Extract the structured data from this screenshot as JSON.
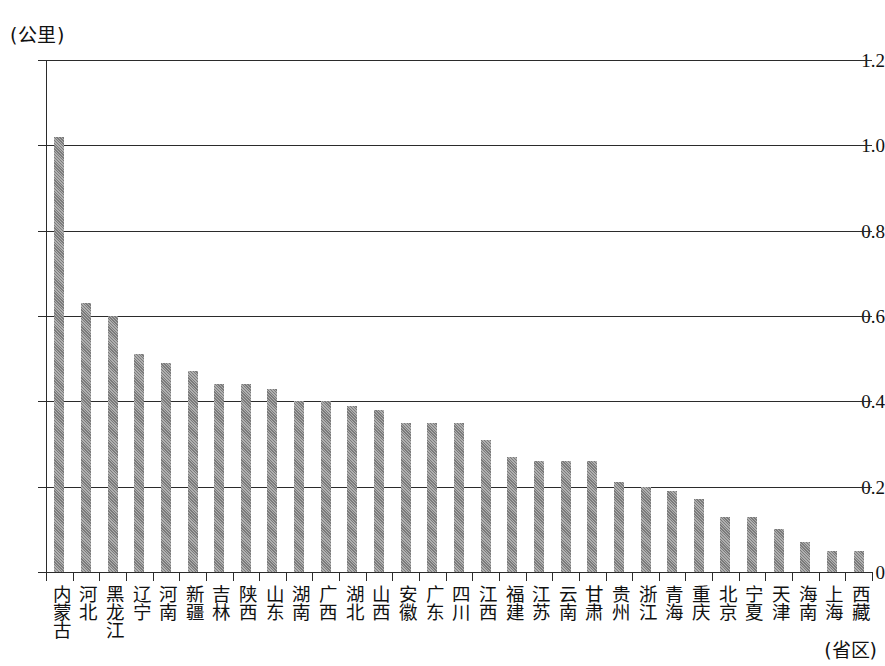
{
  "chart_data": {
    "type": "bar",
    "title": "",
    "subtitle": "",
    "ylabel": "(公里)",
    "xlabel": "(省区)",
    "ylim": [
      0,
      1.2
    ],
    "ytick_labels": [
      "0",
      "0.2",
      "0.4",
      "0.6",
      "0.8",
      "1.0",
      "1.2"
    ],
    "ytick_values": [
      0,
      0.2,
      0.4,
      0.6,
      0.8,
      1.0,
      1.2
    ],
    "grid": true,
    "legend": "none",
    "bar_color": "#8d8d8d",
    "axis_color": "#2b2b2b",
    "categories": [
      "内蒙古",
      "河北",
      "黑龙江",
      "辽宁",
      "河南",
      "新疆",
      "吉林",
      "陕西",
      "山东",
      "湖南",
      "广西",
      "湖北",
      "山西",
      "安徽",
      "广东",
      "四川",
      "江西",
      "福建",
      "江苏",
      "云南",
      "甘肃",
      "贵州",
      "浙江",
      "青海",
      "重庆",
      "北京",
      "宁夏",
      "天津",
      "海南",
      "上海",
      "西藏"
    ],
    "values": [
      1.02,
      0.63,
      0.6,
      0.51,
      0.49,
      0.47,
      0.44,
      0.44,
      0.43,
      0.4,
      0.4,
      0.39,
      0.38,
      0.35,
      0.35,
      0.35,
      0.31,
      0.27,
      0.26,
      0.26,
      0.26,
      0.21,
      0.2,
      0.19,
      0.17,
      0.13,
      0.13,
      0.1,
      0.07,
      0.05,
      0.05
    ]
  }
}
